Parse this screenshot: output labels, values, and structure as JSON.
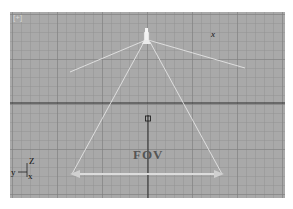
{
  "viewport": {
    "corner_label": "[+]",
    "background": "#a9a9a9",
    "grid_color": "#8e8e8e",
    "axis_color": "#2a2a2a",
    "frustum_color": "#e6e6e6",
    "arrow_color": "#d9d9d9"
  },
  "labels": {
    "fov": "FOV",
    "camera_target_axis": "x"
  },
  "axis_tripod": {
    "z": "Z",
    "y": "y",
    "x": "x"
  },
  "icons": {
    "camera": "camera-icon",
    "target": "target-marker-icon"
  }
}
